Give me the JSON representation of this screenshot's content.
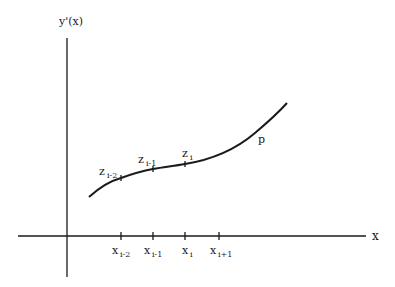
{
  "diagram": {
    "y_axis_label": "y'(x)",
    "x_axis_label": "x",
    "curve_label": "p",
    "curve_points": [
      {
        "name": "z",
        "sub": "i-2"
      },
      {
        "name": "z",
        "sub": "i-1"
      },
      {
        "name": "z",
        "sub": "i"
      }
    ],
    "x_ticks": [
      {
        "name": "x",
        "sub": "i-2"
      },
      {
        "name": "x",
        "sub": "i-1"
      },
      {
        "name": "x",
        "sub": "i"
      },
      {
        "name": "x",
        "sub": "i+1"
      }
    ],
    "colors": {
      "ink": "#1a1a1a",
      "background": "#ffffff"
    }
  }
}
